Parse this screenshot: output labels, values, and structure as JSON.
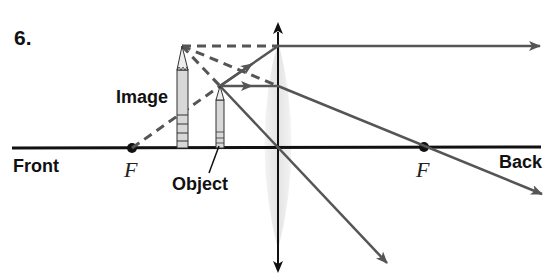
{
  "problem_number": "6.",
  "labels": {
    "front": "Front",
    "back": "Back",
    "image": "Image",
    "object": "Object",
    "focal_front": "F",
    "focal_back": "F"
  },
  "colors": {
    "axis": "#111111",
    "ray": "#555555",
    "lens_fill": "#eeeeee",
    "pencil_body": "#dcdcdc"
  },
  "diagram": {
    "type": "converging lens ray diagram",
    "optical_axis_y": 148,
    "lens_x": 278,
    "focal_points": [
      {
        "label": "F",
        "x": 132
      },
      {
        "label": "F",
        "x": 424
      }
    ],
    "object": {
      "x": 220,
      "tip_y": 86
    },
    "image": {
      "x": 182,
      "tip_y": 46,
      "virtual": true
    }
  }
}
